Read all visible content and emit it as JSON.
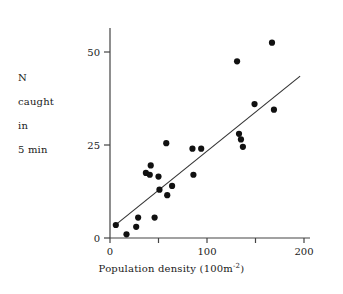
{
  "chart_data": {
    "type": "scatter",
    "title": "",
    "xlabel_parts": {
      "main": "Population density (100m",
      "exponent": "-2",
      "tail": ")"
    },
    "xlabel": "Population density (100m-2)",
    "ylabel_lines": [
      "N",
      "caught",
      "in",
      "5 min"
    ],
    "ylabel": "N caught in 5 min",
    "xlim": [
      0,
      200
    ],
    "ylim": [
      0,
      57
    ],
    "xticks": [
      0,
      50,
      100,
      150,
      200
    ],
    "xtick_labels": [
      "0",
      "",
      "100",
      "",
      "200"
    ],
    "yticks": [
      0,
      25,
      50
    ],
    "ytick_labels": [
      "0",
      "25",
      "50"
    ],
    "grid": false,
    "legend": "none",
    "marker_color": "#111111",
    "line_color": "#333333",
    "axis_color": "#444444",
    "points": [
      {
        "x": 6,
        "y": 3.5
      },
      {
        "x": 17,
        "y": 1.0
      },
      {
        "x": 27,
        "y": 3.0
      },
      {
        "x": 29,
        "y": 5.5
      },
      {
        "x": 37,
        "y": 17.5
      },
      {
        "x": 41,
        "y": 17.0
      },
      {
        "x": 42,
        "y": 19.5
      },
      {
        "x": 46,
        "y": 5.5
      },
      {
        "x": 50,
        "y": 16.5
      },
      {
        "x": 51,
        "y": 13.0
      },
      {
        "x": 58,
        "y": 25.5
      },
      {
        "x": 59,
        "y": 11.5
      },
      {
        "x": 64,
        "y": 14.0
      },
      {
        "x": 85,
        "y": 24.0
      },
      {
        "x": 86,
        "y": 17.0
      },
      {
        "x": 94,
        "y": 24.0
      },
      {
        "x": 131,
        "y": 47.5
      },
      {
        "x": 133,
        "y": 28.0
      },
      {
        "x": 135,
        "y": 26.5
      },
      {
        "x": 137,
        "y": 24.5
      },
      {
        "x": 149,
        "y": 36.0
      },
      {
        "x": 167,
        "y": 52.5
      },
      {
        "x": 169,
        "y": 34.5
      }
    ],
    "fit_line": {
      "type": "linear-regression",
      "x0": 7,
      "y0": 3.8,
      "x1": 196,
      "y1": 43.5
    }
  }
}
